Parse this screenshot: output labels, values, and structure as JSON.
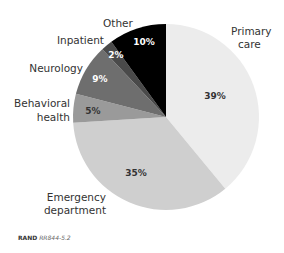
{
  "chart_data": {
    "type": "pie",
    "title": "",
    "start_angle_deg": 0,
    "direction": "clockwise",
    "slices": [
      {
        "label": "Primary care",
        "value": 39,
        "pct_label": "39%",
        "color": "#ececec",
        "text_color": "#333333"
      },
      {
        "label": "Emergency department",
        "value": 35,
        "pct_label": "35%",
        "color": "#cfcfcf",
        "text_color": "#333333"
      },
      {
        "label": "Behavioral health",
        "value": 5,
        "pct_label": "5%",
        "color": "#9a9a9a",
        "text_color": "#333333"
      },
      {
        "label": "Neurology",
        "value": 9,
        "pct_label": "9%",
        "color": "#6e6e6e",
        "text_color": "#ffffff"
      },
      {
        "label": "Inpatient",
        "value": 2,
        "pct_label": "2%",
        "color": "#4a4a4a",
        "text_color": "#ffffff"
      },
      {
        "label": "Other",
        "value": 10,
        "pct_label": "10%",
        "color": "#000000",
        "text_color": "#ffffff"
      }
    ],
    "legend": "none (labels outside slices)"
  },
  "labels": {
    "primary_care_1": "Primary",
    "primary_care_2": "care",
    "emergency_1": "Emergency",
    "emergency_2": "department",
    "behavioral_1": "Behavioral",
    "behavioral_2": "health",
    "neurology": "Neurology",
    "inpatient": "Inpatient",
    "other": "Other"
  },
  "footer": {
    "org": "RAND",
    "id": "RR844-5.2"
  }
}
